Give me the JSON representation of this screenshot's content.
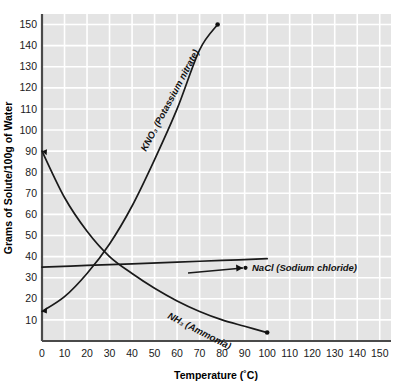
{
  "chart_data": {
    "type": "line",
    "title": "",
    "xlabel": "Temperature (˚C)",
    "ylabel": "Grams of Solute/100g of Water",
    "xlim": [
      0,
      155
    ],
    "ylim": [
      0,
      155
    ],
    "grid": true,
    "legend_position": "inline-annotations",
    "xticks": [
      0,
      10,
      20,
      30,
      40,
      50,
      60,
      70,
      80,
      90,
      100,
      110,
      120,
      130,
      140,
      150
    ],
    "yticks": [
      10,
      20,
      30,
      40,
      50,
      60,
      70,
      80,
      90,
      100,
      110,
      120,
      130,
      140,
      150
    ],
    "series": [
      {
        "name": "KNO3 (Potassium nitrate)",
        "label": "KNO₃ (Potassium nitrate)",
        "x": [
          0,
          10,
          20,
          30,
          40,
          50,
          60,
          70,
          78
        ],
        "values": [
          14,
          21,
          32,
          46,
          64,
          86,
          110,
          138,
          150
        ],
        "endpoint": [
          78,
          150
        ]
      },
      {
        "name": "NaCl (Sodium chloride)",
        "label": "NaCl (Sodium chloride)",
        "x": [
          0,
          20,
          40,
          60,
          80,
          100
        ],
        "values": [
          35,
          35.8,
          36.6,
          37.4,
          38.2,
          39
        ],
        "endpoint": [
          100,
          39
        ]
      },
      {
        "name": "NH3 (Ammonia)",
        "label": "NH₃ (Ammonia)",
        "x": [
          0,
          10,
          20,
          30,
          40,
          50,
          60,
          70,
          80,
          90,
          100
        ],
        "values": [
          90,
          68,
          52,
          40,
          32,
          25,
          19,
          14,
          10,
          7,
          4
        ],
        "endpoint": [
          100,
          4
        ]
      }
    ]
  },
  "colors": {
    "plot_background": "#e4e4e4",
    "gridline": "#ffffff",
    "axis": "#4a4a4a",
    "curve": "#1a1a1a",
    "page_background": "#ffffff"
  }
}
